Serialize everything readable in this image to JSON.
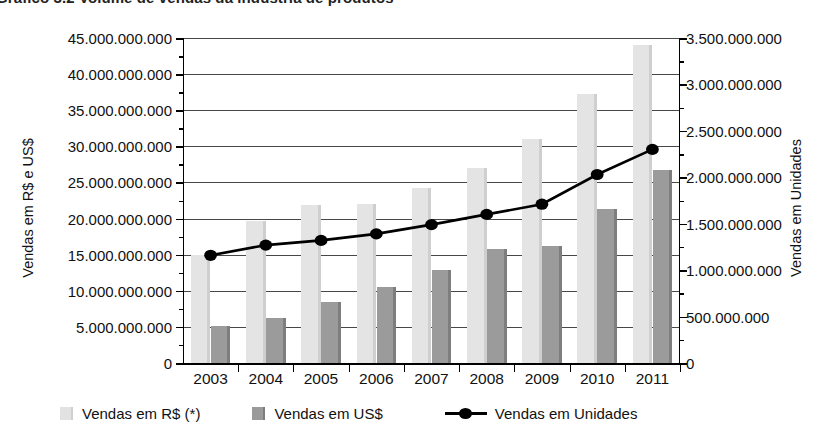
{
  "title": "Gráfico 3.2 Volume de vendas da indústria de produtos",
  "axes": {
    "left_title": "Vendas em R$ e US$",
    "right_title": "Vendas em Unidades",
    "left_ticks": [
      "45.000.000.000",
      "40.000.000.000",
      "35.000.000.000",
      "30.000.000.000",
      "25.000.000.000",
      "20.000.000.000",
      "15.000.000.000",
      "10.000.000.000",
      "5.000.000.000",
      "0"
    ],
    "right_ticks": [
      "3.500.000.000",
      "3.000.000.000",
      "2.500.000.000",
      "2.000.000.000",
      "1.500.000.000",
      "1.000.000.000",
      "500.000.000",
      "0"
    ]
  },
  "legend": {
    "items": [
      {
        "label": "Vendas em R$ (*)",
        "type": "swatch",
        "swatch": "rs",
        "color": "#e2e2e2"
      },
      {
        "label": "Vendas em US$",
        "type": "swatch",
        "swatch": "usd",
        "color": "#9a9a9a"
      },
      {
        "label": "Vendas em Unidades",
        "type": "line",
        "color": "#000000"
      }
    ]
  },
  "colors": {
    "bar_rs": "#e4e4e4",
    "bar_rs_shade": "#cfcfcf",
    "bar_usd": "#9b9b9b",
    "bar_usd_shade": "#7e7e7e",
    "line": "#000000",
    "axis": "#000000"
  },
  "chart_data": {
    "type": "bar",
    "title": "Gráfico 3.2 Volume de vendas da indústria de produtos",
    "xlabel": "",
    "ylabel": "Vendas em R$ e US$",
    "y2label": "Vendas em Unidades",
    "grid": true,
    "legend_position": "bottom",
    "ylim": [
      0,
      45000000000
    ],
    "y2lim": [
      0,
      3500000000
    ],
    "ytick_step": 5000000000,
    "y2tick_step": 500000000,
    "categories": [
      "2003",
      "2004",
      "2005",
      "2006",
      "2007",
      "2008",
      "2009",
      "2010",
      "2011"
    ],
    "series": [
      {
        "name": "Vendas em R$ (*)",
        "axis": "left",
        "kind": "bar",
        "color": "#e4e4e4",
        "values": [
          15000000000,
          19600000000,
          21900000000,
          22000000000,
          24200000000,
          27000000000,
          31000000000,
          37200000000,
          44000000000
        ]
      },
      {
        "name": "Vendas em US$",
        "axis": "left",
        "kind": "bar",
        "color": "#9b9b9b",
        "values": [
          5100000000,
          6300000000,
          8400000000,
          10500000000,
          12900000000,
          15800000000,
          16200000000,
          21300000000,
          26700000000
        ]
      },
      {
        "name": "Vendas em Unidades",
        "axis": "right",
        "kind": "line",
        "color": "#000000",
        "values": [
          1160000000,
          1270000000,
          1320000000,
          1390000000,
          1490000000,
          1600000000,
          1710000000,
          2030000000,
          2300000000
        ]
      }
    ]
  }
}
